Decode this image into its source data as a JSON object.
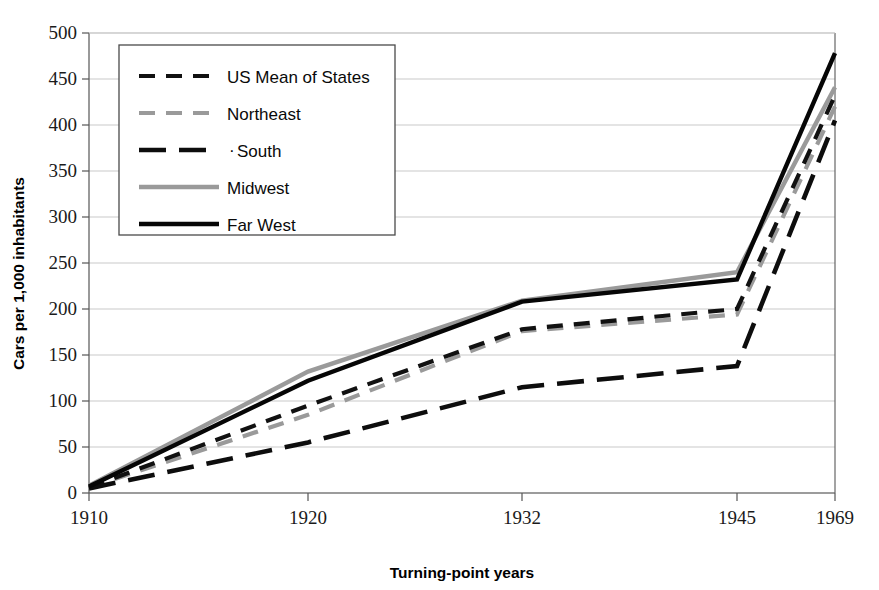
{
  "chart_data": {
    "type": "line",
    "title": "",
    "xlabel": "Turning-point years",
    "ylabel": "Cars per 1,000 inhabitants",
    "categories": [
      "1910",
      "1920",
      "1932",
      "1945",
      "1969"
    ],
    "ylim": [
      0,
      500
    ],
    "yticks": [
      0,
      50,
      100,
      150,
      200,
      250,
      300,
      350,
      400,
      450,
      500
    ],
    "ytick_labels": [
      "0",
      "50",
      "100",
      "150",
      "200",
      "250",
      "300",
      "350",
      "400",
      "450",
      "500"
    ],
    "grid": true,
    "legend_position": "upper-left-inside",
    "series": [
      {
        "name": "US Mean of States",
        "values": [
          6,
          95,
          178,
          200,
          432
        ],
        "color": "#111111",
        "style": "dashed",
        "dasharray": "16 11",
        "width": 4.2
      },
      {
        "name": "Northeast",
        "values": [
          6,
          85,
          176,
          194,
          420
        ],
        "color": "#9a9a9a",
        "style": "dashed",
        "dasharray": "16 11",
        "width": 4.2
      },
      {
        "name": "South",
        "values": [
          5,
          55,
          115,
          138,
          405
        ],
        "color": "#0d0d0d",
        "style": "long-dashed",
        "dasharray": "27 13",
        "width": 4.6
      },
      {
        "name": "Midwest",
        "values": [
          8,
          132,
          209,
          240,
          441
        ],
        "color": "#9a9a9a",
        "style": "solid",
        "dasharray": "0",
        "width": 4.4
      },
      {
        "name": "Far West",
        "values": [
          7,
          122,
          208,
          232,
          478
        ],
        "color": "#060606",
        "style": "solid",
        "dasharray": "0",
        "width": 4.4
      }
    ]
  },
  "legend": {
    "items": [
      {
        "label": "US Mean of States"
      },
      {
        "label": "Northeast"
      },
      {
        "label": "South"
      },
      {
        "label": "Midwest"
      },
      {
        "label": "Far West"
      }
    ],
    "south_marker": "·"
  },
  "axes": {
    "y_title": "Cars per 1,000 inhabitants",
    "x_title": "Turning-point years"
  }
}
